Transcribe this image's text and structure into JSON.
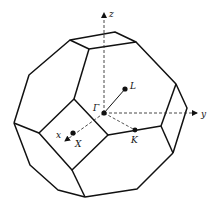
{
  "diagram": {
    "axes": [
      {
        "name": "z",
        "label": "z"
      },
      {
        "name": "y",
        "label": "y"
      },
      {
        "name": "x",
        "label": "x"
      }
    ],
    "points": [
      {
        "name": "gamma",
        "label": "Γ"
      },
      {
        "name": "L",
        "label": "L"
      },
      {
        "name": "K",
        "label": "K"
      },
      {
        "name": "X",
        "label": "X"
      }
    ],
    "colors": {
      "edge": "#111111",
      "background": "#ffffff"
    }
  }
}
